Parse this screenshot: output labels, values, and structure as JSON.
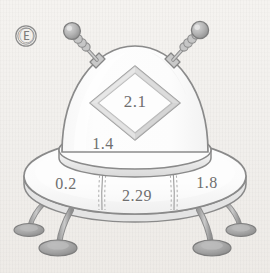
{
  "canvas": {
    "width": 270,
    "height": 273,
    "background_color": "#f2f0ed"
  },
  "logo": {
    "name": "circled-letter-mark",
    "glyph": "Ⓔ",
    "color": "#7c7c7c"
  },
  "illustration": {
    "subject": "flying-saucer",
    "style": "line-art",
    "outline_color": "#8a8a8a",
    "fill_color": "#fcfcfc",
    "shade_color": "#d6d6d6",
    "accent_color": "#b5b5b5"
  },
  "labels": {
    "diamond": {
      "value": "2.1",
      "region": "diamond-window",
      "x": 135,
      "y": 102
    },
    "dome": {
      "value": "1.4",
      "region": "dome-body",
      "x": 103,
      "y": 144
    },
    "saucer_left": {
      "value": "0.2",
      "region": "saucer-segment-left",
      "x": 66,
      "y": 184
    },
    "saucer_center": {
      "value": "2.29",
      "region": "saucer-segment-center",
      "x": 137,
      "y": 196
    },
    "saucer_right": {
      "value": "1.8",
      "region": "saucer-segment-right",
      "x": 207,
      "y": 183
    }
  },
  "parts": [
    {
      "name": "antenna-left",
      "tip": "ball",
      "coil": true
    },
    {
      "name": "antenna-right",
      "tip": "ball",
      "coil": true
    },
    {
      "name": "dome"
    },
    {
      "name": "diamond-window"
    },
    {
      "name": "rim-band"
    },
    {
      "name": "saucer-disc"
    },
    {
      "name": "leg-far-left"
    },
    {
      "name": "leg-near-left"
    },
    {
      "name": "leg-near-right"
    },
    {
      "name": "leg-far-right"
    }
  ]
}
